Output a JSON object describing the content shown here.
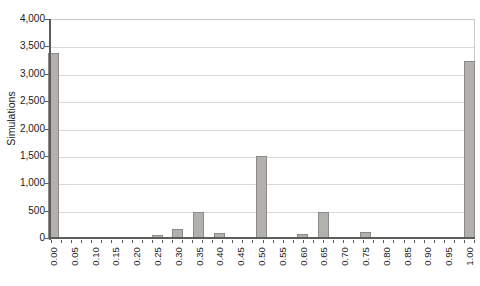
{
  "figure": {
    "background": "#ffffff"
  },
  "chart_data": {
    "type": "bar",
    "title": "",
    "xlabel": "",
    "ylabel": "Simulations",
    "categories": [
      "0.00",
      "0.05",
      "0.10",
      "0.15",
      "0.20",
      "0.25",
      "0.30",
      "0.35",
      "0.40",
      "0.45",
      "0.50",
      "0.55",
      "0.60",
      "0.65",
      "0.70",
      "0.75",
      "0.80",
      "0.85",
      "0.90",
      "0.95",
      "1.00"
    ],
    "values": [
      3400,
      5,
      5,
      15,
      35,
      80,
      175,
      500,
      110,
      30,
      1520,
      45,
      90,
      500,
      20,
      130,
      40,
      10,
      5,
      5,
      3250
    ],
    "ylim": [
      0,
      4000
    ],
    "ytick_interval": 500,
    "ytick_labels": [
      "0",
      "500",
      "1,000",
      "1,500",
      "2,000",
      "2,500",
      "3,000",
      "3,500",
      "4,000"
    ],
    "grid": "horizontal",
    "legend": "none",
    "colors": {
      "bar_fill": "#b3b1ae",
      "bar_border": "#8c8a86",
      "gridline": "#d9d9d9",
      "axis": "#5e5c59",
      "frame": "#c9c9c9",
      "text": "#1a1a1a"
    }
  }
}
